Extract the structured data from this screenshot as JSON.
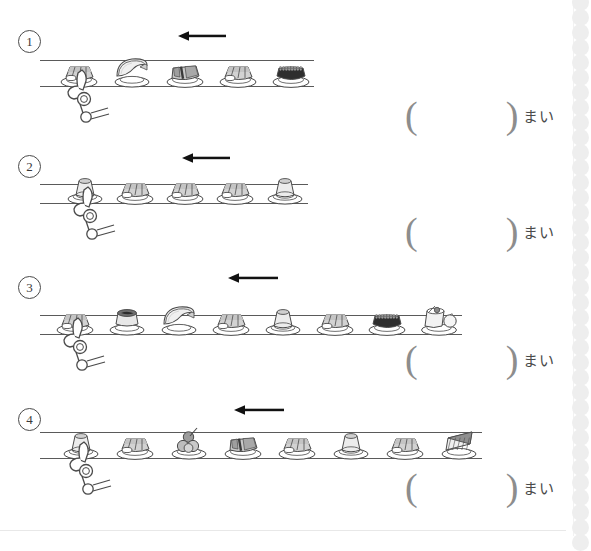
{
  "worksheet": {
    "unit_label": "まい",
    "answer_open_paren": "(",
    "answer_close_paren": ")",
    "belt_direction": "left",
    "colors": {
      "line": "#5a5a5a",
      "text": "#3a3a3a",
      "paren": "#8d8d8d",
      "perforation": "#eeeeee",
      "plate_fill": "#ffffff",
      "food_gray": "#b8b8b8",
      "food_dark": "#3c3c3c"
    },
    "problems": [
      {
        "number": "①",
        "number_plain": "1",
        "plate_count": 5,
        "items": [
          {
            "type": "nigiri-sushi",
            "label": "nigiri"
          },
          {
            "type": "melon-slice",
            "label": "melon"
          },
          {
            "type": "gunkan-sushi",
            "label": "gunkan"
          },
          {
            "type": "nigiri-sushi",
            "label": "nigiri"
          },
          {
            "type": "roe-gunkan",
            "label": "roe"
          }
        ]
      },
      {
        "number": "②",
        "number_plain": "2",
        "plate_count": 5,
        "items": [
          {
            "type": "pudding",
            "label": "pudding"
          },
          {
            "type": "nigiri-sushi",
            "label": "nigiri"
          },
          {
            "type": "nigiri-sushi",
            "label": "nigiri"
          },
          {
            "type": "nigiri-sushi",
            "label": "nigiri"
          },
          {
            "type": "pudding",
            "label": "pudding"
          }
        ]
      },
      {
        "number": "③",
        "number_plain": "3",
        "plate_count": 8,
        "items": [
          {
            "type": "nigiri-sushi",
            "label": "nigiri"
          },
          {
            "type": "miso-soup",
            "label": "soup"
          },
          {
            "type": "melon-slice",
            "label": "melon"
          },
          {
            "type": "nigiri-sushi",
            "label": "nigiri"
          },
          {
            "type": "pudding",
            "label": "pudding"
          },
          {
            "type": "nigiri-sushi",
            "label": "nigiri"
          },
          {
            "type": "roe-gunkan",
            "label": "roe"
          },
          {
            "type": "parfait",
            "label": "parfait"
          }
        ]
      },
      {
        "number": "④",
        "number_plain": "4",
        "plate_count": 8,
        "items": [
          {
            "type": "pudding",
            "label": "pudding"
          },
          {
            "type": "nigiri-sushi",
            "label": "nigiri"
          },
          {
            "type": "fruit-skewer",
            "label": "fruit"
          },
          {
            "type": "gunkan-sushi",
            "label": "gunkan"
          },
          {
            "type": "nigiri-sushi",
            "label": "nigiri"
          },
          {
            "type": "pudding",
            "label": "pudding"
          },
          {
            "type": "nigiri-sushi",
            "label": "nigiri"
          },
          {
            "type": "cake-slice",
            "label": "cake"
          }
        ]
      }
    ]
  }
}
